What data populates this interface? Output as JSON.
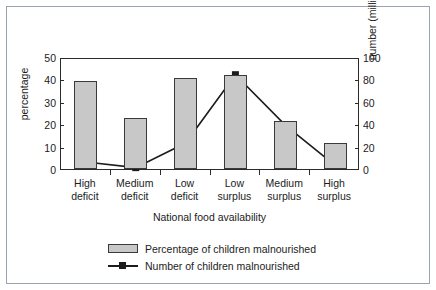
{
  "chart_data": {
    "type": "bar",
    "title": "",
    "xlabel": "National food availability",
    "ylabel": "percentage",
    "ylabel_right": "number (millions)",
    "categories": [
      "High deficit",
      "Medium deficit",
      "Low deficit",
      "Low surplus",
      "Medium surplus",
      "High surplus"
    ],
    "categories_lines": [
      [
        "High",
        "deficit"
      ],
      [
        "Medium",
        "deficit"
      ],
      [
        "Low",
        "deficit"
      ],
      [
        "Low",
        "surplus"
      ],
      [
        "Medium",
        "surplus"
      ],
      [
        "High",
        "surplus"
      ]
    ],
    "series": [
      {
        "name": "Percentage of children malnourished",
        "type": "bar",
        "axis": "left",
        "unit": "percentage",
        "values": [
          39.3,
          22.8,
          40.5,
          42.0,
          21.5,
          11.7
        ]
      },
      {
        "name": "Number of children malnourished",
        "type": "line",
        "axis": "right",
        "unit": "millions",
        "values": [
          8,
          3,
          25,
          86,
          41,
          5
        ]
      }
    ],
    "ylim": [
      0,
      50
    ],
    "ylim_right": [
      0,
      100
    ],
    "yticks": [
      0,
      10,
      20,
      30,
      40,
      50
    ],
    "yticks_right": [
      0,
      20,
      40,
      60,
      80,
      100
    ],
    "ytick_labels": [
      "0",
      "10",
      "20",
      "30",
      "40",
      "50"
    ],
    "ytick_labels_right": [
      "0",
      "20",
      "40",
      "60",
      "80",
      "100"
    ],
    "grid": false,
    "legend_position": "bottom",
    "colors": {
      "bar_fill": "#c8c8c8",
      "bar_edge": "#3a3a3a",
      "line": "#1c1c1c",
      "marker": "#1c1c1c",
      "axis": "#2b2b2b",
      "frame": "#9aa3b0",
      "background": "#ffffff"
    }
  },
  "legend": {
    "items": [
      {
        "label": "Percentage of children malnourished",
        "marker": "bar-swatch"
      },
      {
        "label": "Number of children malnourished",
        "marker": "line-square-swatch"
      }
    ]
  }
}
